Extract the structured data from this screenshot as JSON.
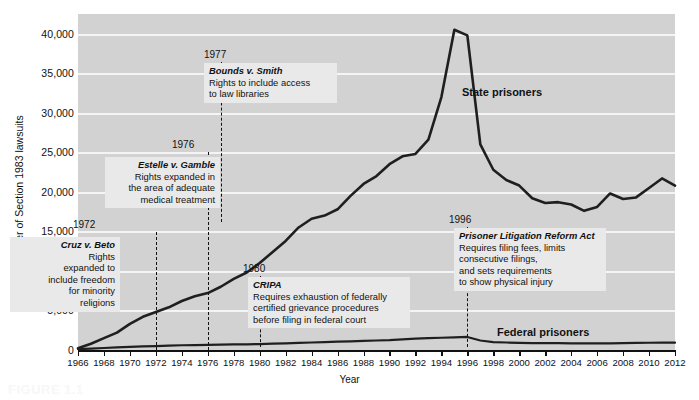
{
  "figure": {
    "caption": "FIGURE 1.1"
  },
  "chart_data": {
    "type": "line",
    "title": "",
    "xlabel": "Year",
    "ylabel": "Number of Section 1983 lawsuits",
    "xlim": [
      1966,
      2012
    ],
    "ylim": [
      0,
      42500
    ],
    "yticks": [
      0,
      5000,
      10000,
      15000,
      20000,
      25000,
      30000,
      35000,
      40000
    ],
    "ytick_labels": [
      "0",
      "5,000",
      "10,000",
      "15,000",
      "20,000",
      "25,000",
      "30,000",
      "35,000",
      "40,000"
    ],
    "xticks": [
      1966,
      1968,
      1970,
      1972,
      1974,
      1976,
      1978,
      1980,
      1982,
      1984,
      1986,
      1988,
      1990,
      1992,
      1994,
      1996,
      1998,
      2000,
      2002,
      2004,
      2006,
      2008,
      2010,
      2012
    ],
    "xtick_labels": [
      "1966",
      "1968",
      "1970",
      "1972",
      "1974",
      "1976",
      "1978",
      "1980",
      "1982",
      "1984",
      "1986",
      "1988",
      "1990",
      "1992",
      "1994",
      "1996",
      "1998",
      "2000",
      "2002",
      "2004",
      "2006",
      "2008",
      "2010",
      "2012"
    ],
    "grid": true,
    "legend_position": "inline-labels",
    "plot_background": "#d2d2d2",
    "line_color": "#1f1f1f",
    "series": [
      {
        "name": "State prisoners",
        "x": [
          1966,
          1967,
          1968,
          1969,
          1970,
          1971,
          1972,
          1973,
          1974,
          1975,
          1976,
          1977,
          1978,
          1979,
          1980,
          1981,
          1982,
          1983,
          1984,
          1985,
          1986,
          1987,
          1988,
          1989,
          1990,
          1991,
          1992,
          1993,
          1994,
          1995,
          1996,
          1997,
          1998,
          1999,
          2000,
          2001,
          2002,
          2003,
          2004,
          2005,
          2006,
          2007,
          2008,
          2009,
          2010,
          2011,
          2012
        ],
        "values": [
          220,
          800,
          1500,
          2200,
          3300,
          4200,
          4800,
          5400,
          6200,
          6800,
          7200,
          8000,
          9000,
          9800,
          11000,
          12400,
          13800,
          15500,
          16600,
          17000,
          17800,
          19500,
          21000,
          22000,
          23500,
          24500,
          24800,
          26600,
          32000,
          40500,
          39800,
          26000,
          22800,
          21500,
          20800,
          19200,
          18600,
          18700,
          18400,
          17600,
          18100,
          19800,
          19100,
          19300,
          20500,
          21700,
          20800
        ]
      },
      {
        "name": "Federal prisoners",
        "x": [
          1966,
          1967,
          1968,
          1969,
          1970,
          1971,
          1972,
          1973,
          1974,
          1975,
          1976,
          1977,
          1978,
          1979,
          1980,
          1981,
          1982,
          1983,
          1984,
          1985,
          1986,
          1987,
          1988,
          1989,
          1990,
          1991,
          1992,
          1993,
          1994,
          1995,
          1996,
          1997,
          1998,
          1999,
          2000,
          2001,
          2002,
          2003,
          2004,
          2005,
          2006,
          2007,
          2008,
          2009,
          2010,
          2011,
          2012
        ],
        "values": [
          120,
          180,
          250,
          320,
          400,
          450,
          500,
          550,
          600,
          620,
          650,
          680,
          700,
          720,
          750,
          800,
          850,
          900,
          950,
          1000,
          1050,
          1100,
          1150,
          1200,
          1250,
          1350,
          1450,
          1500,
          1550,
          1600,
          1650,
          1200,
          1000,
          950,
          900,
          880,
          870,
          860,
          850,
          840,
          830,
          850,
          880,
          900,
          920,
          940,
          930
        ]
      }
    ],
    "annotations": [
      {
        "id": "cruz",
        "year": "1972",
        "title": "Cruz v. Beto",
        "body": "Rights\nexpanded to\ninclude freedom\nfor minority\nreligions",
        "align": "right"
      },
      {
        "id": "estelle",
        "year": "1976",
        "title": "Estelle v. Gamble",
        "body": "Rights expanded in\nthe area of adequate\nmedical treatment",
        "align": "right"
      },
      {
        "id": "bounds",
        "year": "1977",
        "title": "Bounds v. Smith",
        "body": "Rights to include access\nto law libraries",
        "align": "left"
      },
      {
        "id": "cripa",
        "year": "1980",
        "title": "CRIPA",
        "body": "Requires exhaustion of federally\ncertified grievance procedures\nbefore filing in federal court",
        "align": "left"
      },
      {
        "id": "plra",
        "year": "1996",
        "title": "Prisoner Litigation Reform Act",
        "body": "Requires filing fees, limits\nconsecutive filings,\nand sets requirements\nto show physical injury",
        "align": "left"
      }
    ]
  }
}
